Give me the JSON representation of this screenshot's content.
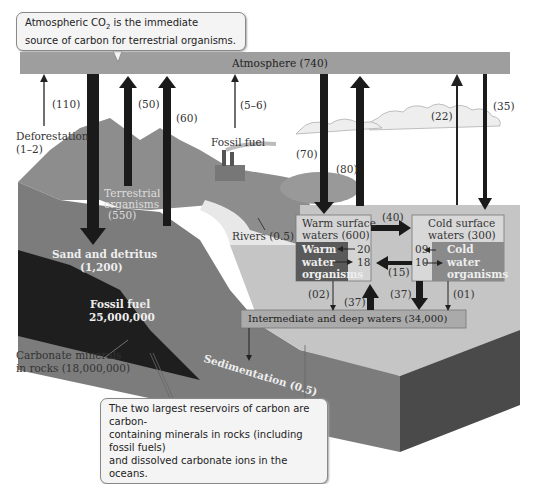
{
  "callouts": {
    "top": "Atmospheric CO₂ is the immediate source of carbon for terrestrial organisms.",
    "top_line1": "Atmospheric CO",
    "top_sub": "2",
    "top_line1_rest": " is the immediate",
    "top_line2": "source of carbon for terrestrial organisms.",
    "bottom_line1": "The two largest reservoirs of carbon are carbon-",
    "bottom_line2": "containing minerals in rocks (including fossil fuels)",
    "bottom_line3": "and dissolved carbonate ions in the oceans."
  },
  "reservoirs": {
    "atmosphere": "Atmosphere (740)",
    "terrestrial_organisms_1": "Terrestrial",
    "terrestrial_organisms_2": "organisms",
    "terrestrial_organisms_3": "(550)",
    "sand_detritus_1": "Sand and detritus",
    "sand_detritus_2": "(1,200)",
    "fossil_fuel_1": "Fossil fuel",
    "fossil_fuel_2": "25,000,000",
    "carbonate_1": "Carbonate minerals",
    "carbonate_2": "in rocks (18,000,000)",
    "warm_surface_1": "Warm surface",
    "warm_surface_2": "waters (600)",
    "warm_org_1": "Warm",
    "warm_org_2": "water",
    "warm_org_3": "organisms",
    "cold_surface_1": "Cold surface",
    "cold_surface_2": "waters (300)",
    "cold_org_1": "Cold",
    "cold_org_2": "water",
    "cold_org_3": "organisms",
    "deep_waters": "Intermediate and deep waters (34,000)"
  },
  "fluxes": {
    "f110": "(110)",
    "deforestation": "Deforestation",
    "deforestation_val": "(1–2)",
    "f50": "(50)",
    "f60": "(60)",
    "f5_6": "(5–6)",
    "fossil_fuel_label": "Fossil fuel",
    "f70": "(70)",
    "f80": "(80)",
    "f22": "(22)",
    "f35": "(35)",
    "rivers": "Rivers (0.5)",
    "f40": "(40)",
    "f20": "20",
    "f18": "18",
    "f09": "09",
    "f10": "10",
    "f15": "(15)",
    "f02": "(02)",
    "f37a": "(37)",
    "f37b": "(37)",
    "f01": "(01)",
    "sedimentation": "Sedimentation (0.5)"
  },
  "colors": {
    "atmosphere_bar": "#9e9e9e",
    "ocean": "#c4c4c4",
    "sediment": "#7a7a7a",
    "fossil_layer": "#1e1e1e",
    "warm_box": "#d0d0d0",
    "warm_org": "#5a5a5a",
    "cold_org": "#8a8a8a",
    "arrow": "#1a1a1a"
  }
}
